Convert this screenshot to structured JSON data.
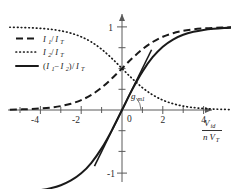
{
  "chart_data": {
    "type": "line",
    "title": "",
    "subtitle": "",
    "xlabel": "V_id / (n V_T)",
    "ylabel": "",
    "xlim": [
      -5.6,
      5.6
    ],
    "ylim": [
      -1.25,
      1.25
    ],
    "xticks": [
      -4,
      -2,
      0,
      2,
      4
    ],
    "xtick_labels": [
      "-4",
      "-2",
      "0",
      "2",
      "4"
    ],
    "yticks": [
      -1,
      1
    ],
    "ytick_labels": [
      "-1",
      "1"
    ],
    "minor_ytick_step": 0.25,
    "minor_xtick_step": 0.5,
    "grid": false,
    "legend_position": "upper-left",
    "annotations": [
      {
        "name": "gm-slope",
        "text": "g",
        "sub": "m1",
        "x": 0.75,
        "y": 0.12
      }
    ],
    "x": [
      -5.5,
      -5.0,
      -4.5,
      -4.0,
      -3.5,
      -3.0,
      -2.5,
      -2.0,
      -1.5,
      -1.0,
      -0.5,
      0.0,
      0.5,
      1.0,
      1.5,
      2.0,
      2.5,
      3.0,
      3.5,
      4.0,
      4.5,
      5.0,
      5.5
    ],
    "series": [
      {
        "name": "I1/IT",
        "style": "dashed",
        "values": [
          0.004,
          0.007,
          0.011,
          0.018,
          0.029,
          0.047,
          0.076,
          0.119,
          0.182,
          0.269,
          0.378,
          0.5,
          0.622,
          0.731,
          0.818,
          0.881,
          0.924,
          0.953,
          0.971,
          0.982,
          0.989,
          0.993,
          0.996
        ]
      },
      {
        "name": "I2/IT",
        "style": "dotted",
        "values": [
          0.996,
          0.993,
          0.989,
          0.982,
          0.971,
          0.953,
          0.924,
          0.881,
          0.818,
          0.731,
          0.622,
          0.5,
          0.378,
          0.269,
          0.182,
          0.119,
          0.076,
          0.047,
          0.029,
          0.018,
          0.011,
          0.007,
          0.004
        ]
      },
      {
        "name": "(I1-I2)/IT",
        "style": "solid",
        "values": [
          -0.993,
          -0.987,
          -0.978,
          -0.964,
          -0.941,
          -0.905,
          -0.848,
          -0.762,
          -0.635,
          -0.462,
          -0.245,
          0.0,
          0.245,
          0.462,
          0.635,
          0.762,
          0.848,
          0.905,
          0.941,
          0.964,
          0.978,
          0.987,
          0.993
        ]
      }
    ]
  },
  "legend": {
    "items": [
      {
        "style": "dashed",
        "num": "I",
        "num_sub": "1",
        "den": "I",
        "den_sub": "T",
        "label": "I1/IT"
      },
      {
        "style": "dotted",
        "num": "I",
        "num_sub": "2",
        "den": "I",
        "den_sub": "T",
        "label": "I2/IT"
      },
      {
        "style": "solid",
        "num": "(I1-I2)",
        "den": "I",
        "den_sub": "T",
        "label": "(I1-I2)/IT"
      }
    ],
    "entry1": {
      "i": "I",
      "one": "1",
      "slash": "/",
      "it": "I",
      "t": "T"
    },
    "entry2": {
      "i": "I",
      "two": "2",
      "slash": "/",
      "it": "I",
      "t": "T"
    },
    "entry3": {
      "open": "(",
      "i1": "I",
      "one": "1",
      "minus": "−",
      "i2": "I",
      "two": "2",
      "close": ")",
      "slash": "/",
      "it": "I",
      "t": "T"
    }
  },
  "axis": {
    "x_label_num": "V",
    "x_label_num_sub": "id",
    "x_label_den_n": "n",
    "x_label_den_v": "V",
    "x_label_den_sub": "T",
    "ytop": "1",
    "ybottom": "-1",
    "zero": "0",
    "xtick_m4": "-4",
    "xtick_m2": "-2",
    "xtick_2": "2",
    "xtick_4": "4"
  },
  "annotation": {
    "gm_main": "g",
    "gm_sub": "m1"
  },
  "colors": {
    "curve": "#1a1a1a",
    "axis": "#5a5a5a",
    "background": "#ffffff"
  }
}
